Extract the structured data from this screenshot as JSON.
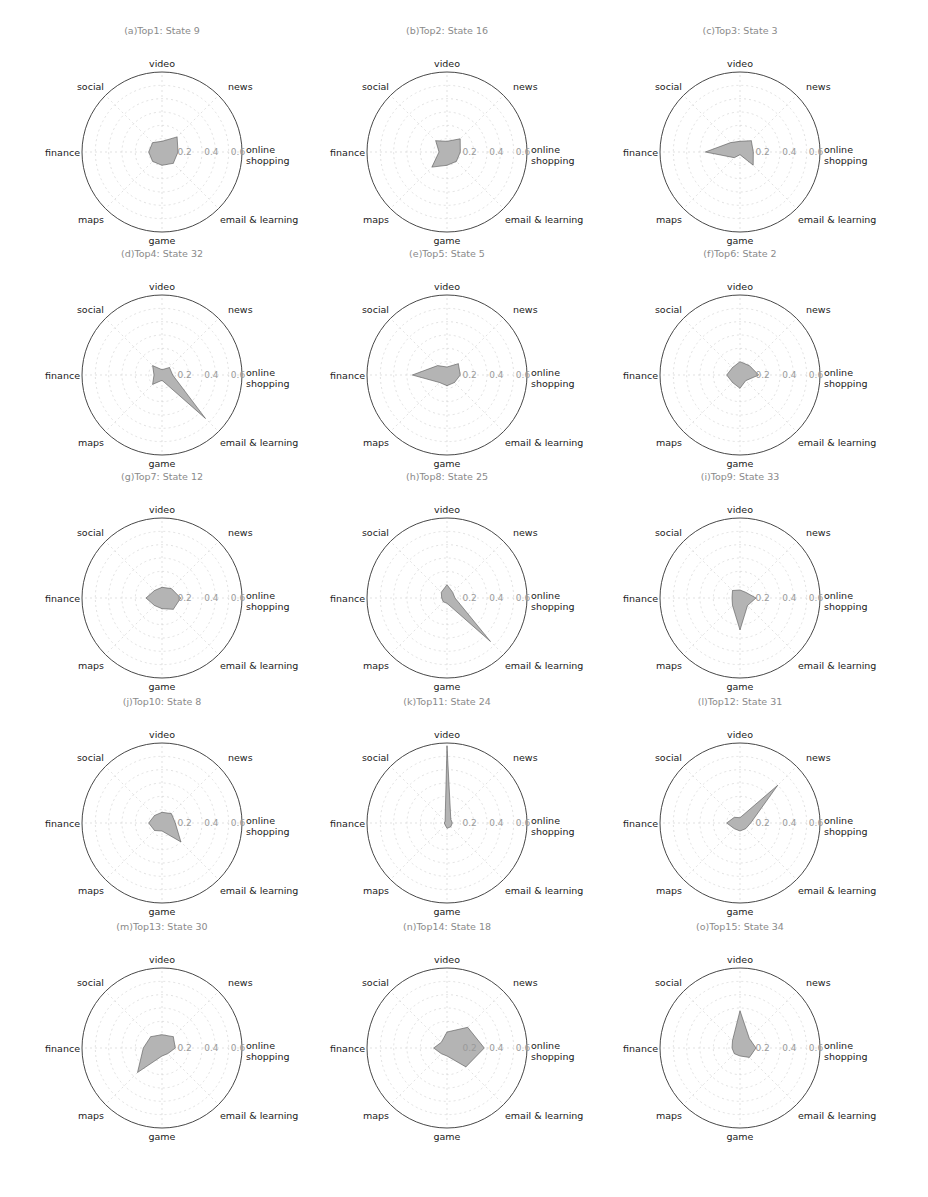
{
  "figure": {
    "caption": "",
    "axes": [
      "online shopping",
      "news",
      "video",
      "social",
      "finance",
      "maps",
      "game",
      "email & learning"
    ],
    "axis_labels": {
      "online_line1": "online",
      "online_line2": "shopping",
      "news": "news",
      "video": "video",
      "social": "social",
      "finance": "finance",
      "maps": "maps",
      "game": "game",
      "email": "email & learning"
    },
    "radial_ticks": [
      "0.2",
      "0.4",
      "0.6"
    ]
  },
  "chart_data": [
    {
      "type": "radar",
      "title": "(a)Top1: State 9",
      "categories": [
        "online shopping",
        "news",
        "video",
        "social",
        "finance",
        "maps",
        "game",
        "email & learning"
      ],
      "values": [
        0.12,
        0.16,
        0.08,
        0.1,
        0.1,
        0.1,
        0.1,
        0.12
      ],
      "rlim": [
        0,
        0.6
      ],
      "rticks": [
        0.2,
        0.4,
        0.6
      ]
    },
    {
      "type": "radar",
      "title": "(b)Top2: State 16",
      "categories": [
        "online shopping",
        "news",
        "video",
        "social",
        "finance",
        "maps",
        "game",
        "email & learning"
      ],
      "values": [
        0.1,
        0.14,
        0.08,
        0.12,
        0.06,
        0.16,
        0.1,
        0.1
      ],
      "rlim": [
        0,
        0.6
      ],
      "rticks": [
        0.2,
        0.4,
        0.6
      ]
    },
    {
      "type": "radar",
      "title": "(c)Top3: State 3",
      "categories": [
        "online shopping",
        "news",
        "video",
        "social",
        "finance",
        "maps",
        "game",
        "email & learning"
      ],
      "values": [
        0.1,
        0.12,
        0.08,
        0.1,
        0.26,
        0.06,
        0.02,
        0.14
      ],
      "rlim": [
        0,
        0.6
      ],
      "rticks": [
        0.2,
        0.4,
        0.6
      ]
    },
    {
      "type": "radar",
      "title": "(d)Top4: State 32",
      "categories": [
        "online shopping",
        "news",
        "video",
        "social",
        "finance",
        "maps",
        "game",
        "email & learning"
      ],
      "values": [
        0.08,
        0.08,
        0.04,
        0.1,
        0.06,
        0.1,
        0.04,
        0.46
      ],
      "rlim": [
        0,
        0.6
      ],
      "rticks": [
        0.2,
        0.4,
        0.6
      ]
    },
    {
      "type": "radar",
      "title": "(e)Top5: State 5",
      "categories": [
        "online shopping",
        "news",
        "video",
        "social",
        "finance",
        "maps",
        "game",
        "email & learning"
      ],
      "values": [
        0.1,
        0.12,
        0.06,
        0.1,
        0.26,
        0.08,
        0.08,
        0.08
      ],
      "rlim": [
        0,
        0.6
      ],
      "rticks": [
        0.2,
        0.4,
        0.6
      ]
    },
    {
      "type": "radar",
      "title": "(f)Top6: State 2",
      "categories": [
        "online shopping",
        "news",
        "video",
        "social",
        "finance",
        "maps",
        "game",
        "email & learning"
      ],
      "values": [
        0.14,
        0.1,
        0.1,
        0.08,
        0.1,
        0.08,
        0.1,
        0.06
      ],
      "rlim": [
        0,
        0.6
      ],
      "rticks": [
        0.2,
        0.4,
        0.6
      ]
    },
    {
      "type": "radar",
      "title": "(g)Top7: State 12",
      "categories": [
        "online shopping",
        "news",
        "video",
        "social",
        "finance",
        "maps",
        "game",
        "email & learning"
      ],
      "values": [
        0.14,
        0.1,
        0.08,
        0.08,
        0.12,
        0.08,
        0.08,
        0.12
      ],
      "rlim": [
        0,
        0.6
      ],
      "rticks": [
        0.2,
        0.4,
        0.6
      ]
    },
    {
      "type": "radar",
      "title": "(h)Top8: State 25",
      "categories": [
        "online shopping",
        "news",
        "video",
        "social",
        "finance",
        "maps",
        "game",
        "email & learning"
      ],
      "values": [
        0.06,
        0.06,
        0.1,
        0.06,
        0.04,
        0.04,
        0.04,
        0.46
      ],
      "rlim": [
        0,
        0.6
      ],
      "rticks": [
        0.2,
        0.4,
        0.6
      ]
    },
    {
      "type": "radar",
      "title": "(i)Top9: State 33",
      "categories": [
        "online shopping",
        "news",
        "video",
        "social",
        "finance",
        "maps",
        "game",
        "email & learning"
      ],
      "values": [
        0.12,
        0.06,
        0.06,
        0.08,
        0.06,
        0.08,
        0.24,
        0.08
      ],
      "rlim": [
        0,
        0.6
      ],
      "rticks": [
        0.2,
        0.4,
        0.6
      ]
    },
    {
      "type": "radar",
      "title": "(j)Top10: State 8",
      "categories": [
        "online shopping",
        "news",
        "video",
        "social",
        "finance",
        "maps",
        "game",
        "email & learning"
      ],
      "values": [
        0.1,
        0.1,
        0.08,
        0.08,
        0.1,
        0.08,
        0.06,
        0.2
      ],
      "rlim": [
        0,
        0.6
      ],
      "rticks": [
        0.2,
        0.4,
        0.6
      ]
    },
    {
      "type": "radar",
      "title": "(k)Top11: State 24",
      "categories": [
        "online shopping",
        "news",
        "video",
        "social",
        "finance",
        "maps",
        "game",
        "email & learning"
      ],
      "values": [
        0.04,
        0.04,
        0.58,
        0.02,
        0.02,
        0.02,
        0.04,
        0.04
      ],
      "rlim": [
        0,
        0.6
      ],
      "rticks": [
        0.2,
        0.4,
        0.6
      ]
    },
    {
      "type": "radar",
      "title": "(l)Top12: State 31",
      "categories": [
        "online shopping",
        "news",
        "video",
        "social",
        "finance",
        "maps",
        "game",
        "email & learning"
      ],
      "values": [
        0.08,
        0.4,
        0.04,
        0.06,
        0.1,
        0.06,
        0.06,
        0.06
      ],
      "rlim": [
        0,
        0.6
      ],
      "rticks": [
        0.2,
        0.4,
        0.6
      ]
    },
    {
      "type": "radar",
      "title": "(m)Top13: State 30",
      "categories": [
        "online shopping",
        "news",
        "video",
        "social",
        "finance",
        "maps",
        "game",
        "email & learning"
      ],
      "values": [
        0.1,
        0.12,
        0.1,
        0.12,
        0.14,
        0.26,
        0.06,
        0.06
      ],
      "rlim": [
        0,
        0.6
      ],
      "rticks": [
        0.2,
        0.4,
        0.6
      ]
    },
    {
      "type": "radar",
      "title": "(n)Top14: State 18",
      "categories": [
        "online shopping",
        "news",
        "video",
        "social",
        "finance",
        "maps",
        "game",
        "email & learning"
      ],
      "values": [
        0.28,
        0.22,
        0.12,
        0.06,
        0.1,
        0.06,
        0.06,
        0.2
      ],
      "rlim": [
        0,
        0.6
      ],
      "rticks": [
        0.2,
        0.4,
        0.6
      ]
    },
    {
      "type": "radar",
      "title": "(o)Top15: State 34",
      "categories": [
        "online shopping",
        "news",
        "video",
        "social",
        "finance",
        "maps",
        "game",
        "email & learning"
      ],
      "values": [
        0.12,
        0.1,
        0.28,
        0.08,
        0.06,
        0.06,
        0.06,
        0.1
      ],
      "rlim": [
        0,
        0.6
      ],
      "rticks": [
        0.2,
        0.4,
        0.6
      ]
    }
  ]
}
